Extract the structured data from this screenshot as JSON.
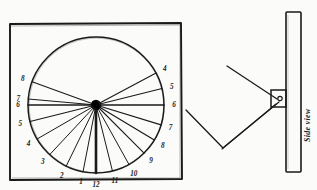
{
  "figure": {
    "background_color": "#fbfbfa",
    "ink_color": "#1a1a1a"
  },
  "dial_panel": {
    "name": "Dial face plate",
    "board": {
      "x": 9,
      "y": 23,
      "width": 173,
      "height": 157
    },
    "circle": {
      "cx": 96,
      "cy": 105,
      "r": 68
    },
    "hub": {
      "cx": 96,
      "cy": 105,
      "r": 5
    },
    "noon_line_label": "12",
    "hour_labels": [
      {
        "label": "8",
        "angle_deg": 200,
        "radius": 78,
        "side": "left"
      },
      {
        "label": "7",
        "angle_deg": 185,
        "radius": 78,
        "side": "left"
      },
      {
        "label": "6",
        "angle_deg": 180,
        "radius": 78,
        "side": "left"
      },
      {
        "label": "5",
        "angle_deg": 166,
        "radius": 78,
        "side": "left"
      },
      {
        "label": "4",
        "angle_deg": 150,
        "radius": 78,
        "side": "left"
      },
      {
        "label": "3",
        "angle_deg": 133,
        "radius": 78,
        "side": "left"
      },
      {
        "label": "2",
        "angle_deg": 116,
        "radius": 78,
        "side": "left"
      },
      {
        "label": "1",
        "angle_deg": 101,
        "radius": 78,
        "side": "left"
      },
      {
        "label": "12",
        "angle_deg": 90,
        "radius": 80,
        "side": "bottom"
      },
      {
        "label": "11",
        "angle_deg": 76,
        "radius": 78,
        "side": "right"
      },
      {
        "label": "10",
        "angle_deg": 61,
        "radius": 78,
        "side": "right"
      },
      {
        "label": "9",
        "angle_deg": 45,
        "radius": 78,
        "side": "right"
      },
      {
        "label": "8",
        "angle_deg": 31,
        "radius": 78,
        "side": "right"
      },
      {
        "label": "7",
        "angle_deg": 17,
        "radius": 78,
        "side": "right"
      },
      {
        "label": "6",
        "angle_deg": 0,
        "radius": 78,
        "side": "right"
      },
      {
        "label": "5",
        "angle_deg": -14,
        "radius": 78,
        "side": "right"
      },
      {
        "label": "4",
        "angle_deg": -28,
        "radius": 78,
        "side": "right"
      }
    ],
    "hour_lines": [
      {
        "hour": "8L",
        "angle_deg": 200,
        "weight": 1.1
      },
      {
        "hour": "7L",
        "angle_deg": 185,
        "weight": 1.1
      },
      {
        "hour": "6L",
        "angle_deg": 180,
        "weight": 1.5
      },
      {
        "hour": "5L",
        "angle_deg": 166,
        "weight": 1.1
      },
      {
        "hour": "4L",
        "angle_deg": 150,
        "weight": 1.0
      },
      {
        "hour": "3L",
        "angle_deg": 133,
        "weight": 1.0
      },
      {
        "hour": "2L",
        "angle_deg": 116,
        "weight": 1.0
      },
      {
        "hour": "1L",
        "angle_deg": 101,
        "weight": 1.0
      },
      {
        "hour": "12",
        "angle_deg": 90,
        "weight": 2.6
      },
      {
        "hour": "11R",
        "angle_deg": 76,
        "weight": 1.0
      },
      {
        "hour": "10R",
        "angle_deg": 61,
        "weight": 1.0
      },
      {
        "hour": "9R",
        "angle_deg": 45,
        "weight": 1.1
      },
      {
        "hour": "8R",
        "angle_deg": 31,
        "weight": 1.2
      },
      {
        "hour": "7R",
        "angle_deg": 17,
        "weight": 1.1
      },
      {
        "hour": "6R",
        "angle_deg": 0,
        "weight": 1.5
      },
      {
        "hour": "5R",
        "angle_deg": -14,
        "weight": 1.1
      },
      {
        "hour": "4R",
        "angle_deg": -28,
        "weight": 1.1
      }
    ]
  },
  "side_panel": {
    "name": "Side view of mounted dial",
    "caption": "Side view",
    "board": {
      "x": 286,
      "y": 12,
      "width": 15,
      "height": 160
    },
    "bracket": {
      "x": 271,
      "y": 90,
      "width": 15,
      "height": 17
    },
    "pivot_hole": {
      "cx": 280,
      "cy": 98,
      "r": 2.1
    },
    "gnomon": {
      "upper_arm": {
        "x1": 278,
        "y1": 99,
        "x2": 227,
        "y2": 66
      },
      "lower_arm_a": {
        "x1": 279,
        "y1": 102,
        "x2": 224,
        "y2": 146
      },
      "lower_arm_b": {
        "x1": 277,
        "y1": 104,
        "x2": 223,
        "y2": 148
      },
      "return_arm": {
        "x1": 223,
        "y1": 147,
        "x2": 186,
        "y2": 110
      }
    }
  }
}
